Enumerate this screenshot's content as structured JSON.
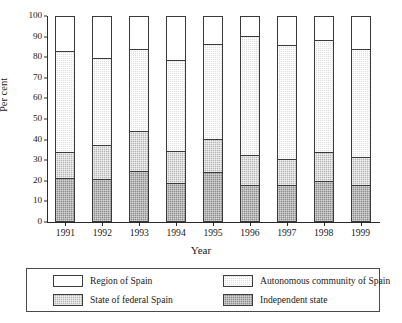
{
  "chart_data": {
    "type": "bar",
    "subtype": "stacked-bar-100",
    "title": "",
    "xlabel": "Year",
    "ylabel": "Per cent",
    "ylim": [
      0,
      100
    ],
    "yticks": [
      0,
      10,
      20,
      30,
      40,
      50,
      60,
      70,
      80,
      90,
      100
    ],
    "grid": false,
    "legend_position": "bottom",
    "categories": [
      "1991",
      "1992",
      "1993",
      "1994",
      "1995",
      "1996",
      "1997",
      "1998",
      "1999"
    ],
    "series": [
      {
        "name": "Independent state",
        "color": "#8d8d8d",
        "values": [
          20.5,
          20.0,
          24.0,
          18.0,
          23.5,
          17.0,
          17.0,
          19.0,
          17.0
        ]
      },
      {
        "name": "State of federal Spain",
        "color": "#b4b4b4",
        "values": [
          13.0,
          17.0,
          19.5,
          16.0,
          16.0,
          15.0,
          13.0,
          14.5,
          14.0
        ]
      },
      {
        "name": "Autonomous community of Spain",
        "color": "#dedede",
        "values": [
          49.5,
          42.5,
          40.5,
          44.5,
          47.0,
          58.0,
          56.0,
          54.5,
          53.0
        ]
      },
      {
        "name": "Region of Spain",
        "color": "#ffffff",
        "values": [
          17.0,
          20.5,
          16.0,
          21.5,
          13.5,
          10.0,
          14.0,
          12.0,
          16.0
        ]
      }
    ],
    "cumulative_tops": {
      "1991": [
        20.5,
        33.5,
        83.0,
        100
      ],
      "1992": [
        20.0,
        37.0,
        79.5,
        100
      ],
      "1993": [
        24.0,
        43.5,
        84.0,
        100
      ],
      "1994": [
        18.0,
        34.0,
        78.5,
        100
      ],
      "1995": [
        23.5,
        39.5,
        86.5,
        100
      ],
      "1996": [
        17.0,
        32.0,
        90.0,
        100
      ],
      "1997": [
        17.0,
        30.0,
        86.0,
        100
      ],
      "1998": [
        19.0,
        33.5,
        88.0,
        100
      ],
      "1999": [
        17.0,
        31.0,
        84.0,
        100
      ]
    }
  },
  "legend": {
    "items": [
      {
        "label": "Region of Spain",
        "swatch": "region-of-spain-swatch"
      },
      {
        "label": "Autonomous community of Spain",
        "swatch": "autonomous-community-swatch"
      },
      {
        "label": "State of federal Spain",
        "swatch": "state-of-federal-spain-swatch"
      },
      {
        "label": "Independent state",
        "swatch": "independent-state-swatch"
      }
    ]
  }
}
